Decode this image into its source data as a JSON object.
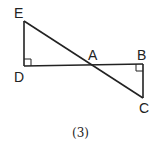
{
  "figure": {
    "caption": "(3)",
    "points": {
      "E": {
        "label": "E",
        "x": 24,
        "y": 21
      },
      "D": {
        "label": "D",
        "x": 24,
        "y": 66
      },
      "A": {
        "label": "A",
        "x": 93,
        "y": 65
      },
      "B": {
        "label": "B",
        "x": 143,
        "y": 64
      },
      "C": {
        "label": "C",
        "x": 143,
        "y": 98
      }
    },
    "segments": [
      "ED",
      "DB",
      "EC",
      "BC"
    ],
    "right_angles": [
      "D",
      "B"
    ],
    "colors": {
      "stroke": "#222222",
      "background": "#ffffff"
    }
  }
}
